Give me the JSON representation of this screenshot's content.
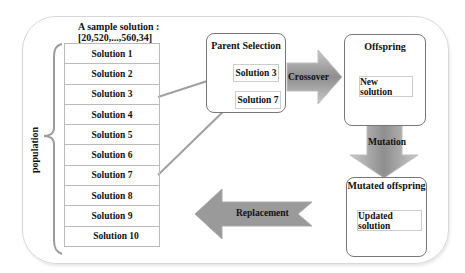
{
  "diagram": {
    "sample_solution": {
      "label": "A sample solution :",
      "value": "[20,520,...,560,34]"
    },
    "population": {
      "label": "population",
      "solutions": [
        "Solution 1",
        "Solution 2",
        "Solution 3",
        "Solution 4",
        "Solution 5",
        "Solution 6",
        "Solution 7",
        "Solution 8",
        "Solution 9",
        "Solution 10"
      ]
    },
    "parent_selection": {
      "title": "Parent Selection",
      "selected": [
        "Solution 3",
        "Solution 7"
      ]
    },
    "crossover": {
      "label": "Crossover"
    },
    "offspring": {
      "title": "Offspring",
      "item": "New solution"
    },
    "mutation": {
      "label": "Mutation"
    },
    "mutated_offspring": {
      "title": "Mutated offspring",
      "item": "Updated solution"
    },
    "replacement": {
      "label": "Replacement"
    },
    "colors": {
      "arrow_fill": "#9a9a9a",
      "arrow_highlight": "#c8c8c8",
      "connector": "#a0a0a0",
      "box_border": "#777777",
      "frame_border": "#d8d8d8"
    }
  }
}
